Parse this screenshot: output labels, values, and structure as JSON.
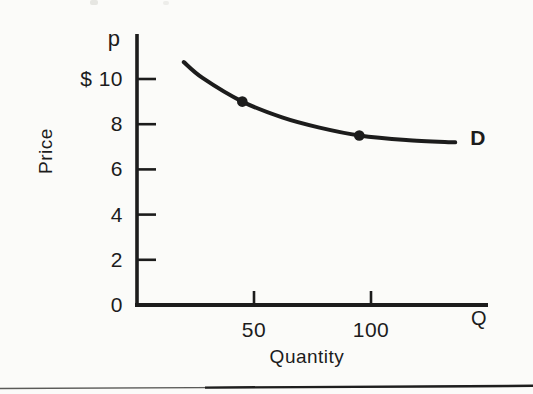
{
  "page": {
    "background": "#fbfbf9",
    "ink": "#1c1c1c"
  },
  "figure_labels": {
    "y_axis_symbol": "p",
    "x_axis_symbol": "Q",
    "y_axis_title": "Price",
    "x_axis_title": "Quantity",
    "curve_label": "D"
  },
  "chart_data": {
    "type": "line",
    "title": "",
    "xlabel": "Quantity",
    "ylabel": "Price",
    "x_symbol": "Q",
    "y_symbol": "p",
    "xlim": [
      0,
      150
    ],
    "ylim": [
      0,
      12
    ],
    "grid": false,
    "legend": "inline-right",
    "x_ticks": [
      {
        "value": 50,
        "label": "50"
      },
      {
        "value": 100,
        "label": "100"
      }
    ],
    "y_ticks": [
      {
        "value": 10,
        "label": "$ 10"
      },
      {
        "value": 8,
        "label": "8"
      },
      {
        "value": 6,
        "label": "6"
      },
      {
        "value": 4,
        "label": "4"
      },
      {
        "value": 2,
        "label": "2"
      },
      {
        "value": 0,
        "label": "0"
      }
    ],
    "series": [
      {
        "name": "D",
        "description": "Downward-sloping demand curve, flattening at higher quantity",
        "points": [
          {
            "q": 20,
            "p": 10.75
          },
          {
            "q": 28,
            "p": 10.05
          },
          {
            "q": 45,
            "p": 9.0
          },
          {
            "q": 62,
            "p": 8.3
          },
          {
            "q": 78,
            "p": 7.85
          },
          {
            "q": 95,
            "p": 7.5
          },
          {
            "q": 115,
            "p": 7.3
          },
          {
            "q": 136,
            "p": 7.2
          }
        ]
      }
    ],
    "marked_points": [
      {
        "q": 45,
        "p": 9.0
      },
      {
        "q": 95,
        "p": 7.5
      }
    ]
  }
}
